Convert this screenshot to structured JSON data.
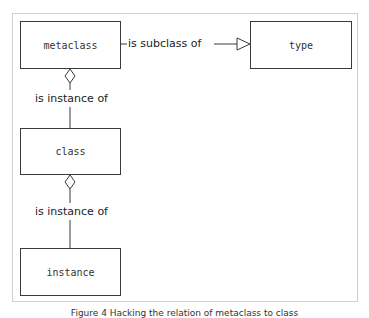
{
  "diagram": {
    "nodes": [
      {
        "id": "metaclass",
        "label": "metaclass"
      },
      {
        "id": "type",
        "label": "type"
      },
      {
        "id": "class",
        "label": "class"
      },
      {
        "id": "instance",
        "label": "instance"
      }
    ],
    "edges": [
      {
        "from": "metaclass",
        "to": "type",
        "label": "is subclass of",
        "arrow": "hollow-triangle"
      },
      {
        "from": "class",
        "to": "metaclass",
        "label": "is instance of",
        "arrow": "hollow-diamond"
      },
      {
        "from": "instance",
        "to": "class",
        "label": "is instance of",
        "arrow": "hollow-diamond"
      }
    ],
    "caption": "Figure 4 Hacking the relation of metaclass to class"
  },
  "colors": {
    "line": "#3a3a3a",
    "frame_border": "#cfcfcf",
    "background": "#ffffff"
  }
}
